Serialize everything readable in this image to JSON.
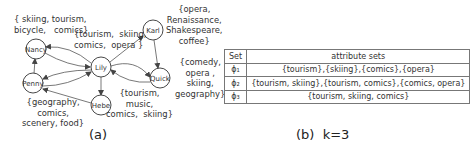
{
  "figure_a": {
    "caption": "(a)",
    "nodes": [
      {
        "id": "nancy",
        "label": "Nancy"
      },
      {
        "id": "lily",
        "label": "Lily"
      },
      {
        "id": "karl",
        "label": "Karl"
      },
      {
        "id": "quick",
        "label": "Quick"
      },
      {
        "id": "penny",
        "label": "Penny"
      },
      {
        "id": "hebe",
        "label": "Hebe"
      }
    ],
    "attributes": {
      "nancy": "{ skiing, tourism,\nbicycle,   comics}",
      "lily": "{tourism,  skiing,\ncomics,  opera }",
      "karl": "{opera,\nRenaissance,\nShakespeare,\ncoffee}",
      "quick": "{comedy,\nopera ,\nskiing,\ngeography}",
      "penny": "{geography,\ncomics,\nscenery, food}",
      "hebe": "{tourism,\nmusic,\ncomics,  skiing}"
    }
  },
  "figure_b": {
    "caption": "(b)  k=3",
    "table": {
      "headers": [
        "Set",
        "attribute sets"
      ],
      "rows": [
        [
          "ϕ₁",
          "{tourism},{skiing},{comics},{opera}"
        ],
        [
          "ϕ₂",
          "{tourism, skiing},{tourism, comics},{comics, opera}"
        ],
        [
          "ϕ₃",
          "{tourism, skiing, comics}"
        ]
      ]
    }
  }
}
